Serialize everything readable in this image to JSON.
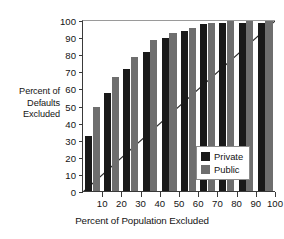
{
  "chart_data": {
    "type": "bar",
    "title": "",
    "subtitle": "",
    "xlabel": "Percent of Population Excluded",
    "ylabel": "Percent of Defaults Excluded",
    "ylabel_lines": [
      "Percent of",
      "Defaults",
      "Excluded"
    ],
    "categories": [
      "10",
      "20",
      "30",
      "40",
      "50",
      "60",
      "70",
      "80",
      "90",
      "100"
    ],
    "series": [
      {
        "name": "Private",
        "color": "#191919",
        "values": [
          33,
          58,
          72,
          82,
          90,
          94,
          98,
          99,
          99,
          99
        ]
      },
      {
        "name": "Public",
        "color": "#6e6e6e",
        "values": [
          50,
          67,
          79,
          89,
          93,
          96,
          99,
          100,
          100,
          100
        ]
      }
    ],
    "xlim": [
      0,
      100
    ],
    "ylim": [
      0,
      100
    ],
    "yticks": [
      0,
      10,
      20,
      30,
      40,
      50,
      60,
      70,
      80,
      90,
      100
    ],
    "ytick_labels": [
      "0",
      "10",
      "20",
      "30",
      "40",
      "50",
      "60",
      "70",
      "80",
      "90",
      "100"
    ],
    "xticks": [
      10,
      20,
      30,
      40,
      50,
      60,
      70,
      80,
      90,
      100
    ],
    "xtick_labels": [
      "10",
      "20",
      "30",
      "40",
      "50",
      "60",
      "70",
      "80",
      "90",
      "100"
    ],
    "grid": false,
    "legend_position": "lower right",
    "legend_entries": [
      "Private",
      "Public"
    ],
    "annotations": [
      {
        "type": "reference-line",
        "description": "diagonal 45-degree line from origin to top-right corner",
        "from": [
          0,
          0
        ],
        "to": [
          100,
          100
        ]
      }
    ]
  },
  "legend": {
    "private_label": "Private",
    "public_label": "Public"
  },
  "axes": {
    "x_title": "Percent of Population Excluded",
    "y_title_line1": "Percent of",
    "y_title_line2": "Defaults",
    "y_title_line3": "Excluded"
  },
  "colors": {
    "private": "#191919",
    "public": "#6e6e6e",
    "axis": "#3a3a3a",
    "background": "#ffffff"
  }
}
